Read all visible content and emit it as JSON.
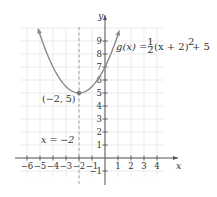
{
  "chart_data": {
    "type": "line",
    "title": "",
    "function_label": "g(x) = 1/2(x + 2)^2 + 5",
    "function_label_parts": {
      "lhs": "g(x) = ",
      "num": "1",
      "den": "2",
      "rhs": "(x + 2)",
      "exp": "2",
      "tail": " + 5"
    },
    "xlabel": "x",
    "ylabel": "y",
    "xlim": [
      -6.5,
      4.5
    ],
    "ylim": [
      -1.5,
      10
    ],
    "x_ticks": [
      -6,
      -5,
      -4,
      -3,
      -2,
      -1,
      1,
      2,
      3,
      4
    ],
    "x_tick_labels": [
      "−6",
      "−5",
      "−4",
      "−3",
      "−2",
      "−1",
      "1",
      "2",
      "3",
      "4"
    ],
    "y_ticks": [
      1,
      2,
      3,
      4,
      5,
      6,
      7,
      8,
      9,
      -1
    ],
    "y_tick_labels": [
      "1",
      "2",
      "3",
      "4",
      "5",
      "6",
      "7",
      "8",
      "9",
      "−1"
    ],
    "grid": true,
    "series": [
      {
        "name": "g(x)",
        "formula": "0.5*(x+2)^2+5",
        "x": [
          -5.2,
          -5,
          -4.5,
          -4,
          -3.5,
          -3,
          -2.5,
          -2,
          -1.5,
          -1,
          -0.5,
          0,
          0.5,
          1.1
        ],
        "values": [
          10.12,
          9.5,
          8.125,
          7,
          6.125,
          5.5,
          5.125,
          5,
          5.125,
          5.5,
          6.125,
          7,
          8.125,
          9.805
        ],
        "color": "#8a8a8a"
      }
    ],
    "annotations": [
      {
        "type": "point",
        "x": -2,
        "y": 5,
        "label": "(−2, 5)"
      },
      {
        "type": "vline",
        "x": -2,
        "style": "dashed",
        "label": "x = −2"
      }
    ]
  },
  "colors": {
    "grid": "#e6e6e6",
    "axis": "#555555",
    "curve": "#8a8a8a",
    "axis_of_symmetry": "#9a9a9a"
  }
}
